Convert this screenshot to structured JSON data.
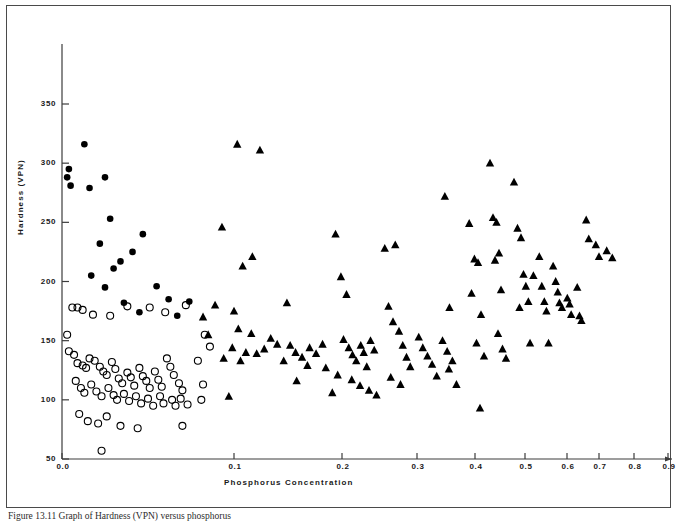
{
  "figure": {
    "caption": "Figure 13.11  Graph of Hardness (VPN) versus phosphorus"
  },
  "chart_data": {
    "type": "scatter",
    "title": "",
    "xlabel": "Phosphorus  Concentration",
    "ylabel": "Hardness  (VPN)",
    "xlim": [
      0.0,
      0.92
    ],
    "ylim": [
      50,
      360
    ],
    "grid": false,
    "legend": "none",
    "xticks": [
      0.0,
      0.1,
      0.2,
      0.3,
      0.4,
      0.5,
      0.6,
      0.7,
      0.8,
      0.9
    ],
    "xtick_labels": [
      "0.0",
      "0.1",
      "0.2",
      "0.3",
      "0.4",
      "0.5",
      "0.6",
      "0.7",
      "0.8",
      "0.9"
    ],
    "yticks": [
      50,
      100,
      150,
      200,
      250,
      300,
      350
    ],
    "ytick_labels": [
      "50",
      "100",
      "150",
      "200",
      "250",
      "300",
      "350"
    ],
    "xtick_pixels": [
      62,
      234,
      342,
      417,
      475,
      525,
      567,
      599,
      634,
      668
    ],
    "series": [
      {
        "name": "filled-circle",
        "marker": "filled-circle",
        "color": "#000000",
        "points": [
          [
            0.004,
            295
          ],
          [
            0.003,
            288
          ],
          [
            0.005,
            281
          ],
          [
            0.016,
            279
          ],
          [
            0.013,
            316
          ],
          [
            0.025,
            288
          ],
          [
            0.028,
            253
          ],
          [
            0.022,
            232
          ],
          [
            0.034,
            217
          ],
          [
            0.047,
            240
          ],
          [
            0.041,
            225
          ],
          [
            0.03,
            211
          ],
          [
            0.017,
            205
          ],
          [
            0.025,
            195
          ],
          [
            0.055,
            196
          ],
          [
            0.062,
            185
          ],
          [
            0.036,
            182
          ],
          [
            0.074,
            183
          ],
          [
            0.045,
            174
          ],
          [
            0.067,
            171
          ]
        ]
      },
      {
        "name": "open-circle",
        "marker": "open-circle",
        "color": "#000000",
        "points": [
          [
            0.003,
            155
          ],
          [
            0.006,
            178
          ],
          [
            0.009,
            178
          ],
          [
            0.012,
            176
          ],
          [
            0.018,
            172
          ],
          [
            0.028,
            171
          ],
          [
            0.038,
            179
          ],
          [
            0.051,
            178
          ],
          [
            0.06,
            174
          ],
          [
            0.072,
            180
          ],
          [
            0.004,
            141
          ],
          [
            0.007,
            138
          ],
          [
            0.009,
            131
          ],
          [
            0.012,
            129
          ],
          [
            0.014,
            127
          ],
          [
            0.016,
            135
          ],
          [
            0.019,
            133
          ],
          [
            0.022,
            128
          ],
          [
            0.024,
            124
          ],
          [
            0.026,
            121
          ],
          [
            0.029,
            132
          ],
          [
            0.031,
            126
          ],
          [
            0.033,
            118
          ],
          [
            0.035,
            114
          ],
          [
            0.038,
            123
          ],
          [
            0.04,
            119
          ],
          [
            0.042,
            112
          ],
          [
            0.045,
            127
          ],
          [
            0.047,
            120
          ],
          [
            0.049,
            116
          ],
          [
            0.051,
            110
          ],
          [
            0.054,
            124
          ],
          [
            0.056,
            117
          ],
          [
            0.058,
            111
          ],
          [
            0.061,
            135
          ],
          [
            0.063,
            128
          ],
          [
            0.065,
            121
          ],
          [
            0.068,
            114
          ],
          [
            0.07,
            108
          ],
          [
            0.008,
            116
          ],
          [
            0.011,
            110
          ],
          [
            0.013,
            106
          ],
          [
            0.017,
            113
          ],
          [
            0.02,
            107
          ],
          [
            0.023,
            103
          ],
          [
            0.027,
            110
          ],
          [
            0.03,
            104
          ],
          [
            0.032,
            100
          ],
          [
            0.036,
            105
          ],
          [
            0.039,
            99
          ],
          [
            0.043,
            103
          ],
          [
            0.046,
            97
          ],
          [
            0.05,
            101
          ],
          [
            0.053,
            95
          ],
          [
            0.057,
            103
          ],
          [
            0.059,
            97
          ],
          [
            0.064,
            100
          ],
          [
            0.066,
            95
          ],
          [
            0.069,
            101
          ],
          [
            0.073,
            96
          ],
          [
            0.01,
            88
          ],
          [
            0.015,
            82
          ],
          [
            0.021,
            80
          ],
          [
            0.026,
            86
          ],
          [
            0.034,
            78
          ],
          [
            0.044,
            76
          ],
          [
            0.07,
            78
          ],
          [
            0.023,
            57
          ],
          [
            0.081,
            100
          ],
          [
            0.082,
            113
          ],
          [
            0.079,
            133
          ],
          [
            0.083,
            155
          ],
          [
            0.086,
            145
          ]
        ]
      },
      {
        "name": "filled-triangle",
        "marker": "filled-triangle",
        "color": "#000000",
        "points": [
          [
            0.103,
            316
          ],
          [
            0.124,
            311
          ],
          [
            0.093,
            246
          ],
          [
            0.117,
            221
          ],
          [
            0.108,
            213
          ],
          [
            0.089,
            180
          ],
          [
            0.1,
            175
          ],
          [
            0.104,
            160
          ],
          [
            0.116,
            156
          ],
          [
            0.099,
            144
          ],
          [
            0.111,
            140
          ],
          [
            0.121,
            139
          ],
          [
            0.094,
            135
          ],
          [
            0.106,
            133
          ],
          [
            0.128,
            143
          ],
          [
            0.134,
            152
          ],
          [
            0.14,
            147
          ],
          [
            0.097,
            103
          ],
          [
            0.085,
            155
          ],
          [
            0.082,
            170
          ],
          [
            0.149,
            182
          ],
          [
            0.152,
            146
          ],
          [
            0.157,
            140
          ],
          [
            0.163,
            136
          ],
          [
            0.17,
            144
          ],
          [
            0.176,
            139
          ],
          [
            0.182,
            147
          ],
          [
            0.146,
            133
          ],
          [
            0.168,
            129
          ],
          [
            0.185,
            127
          ],
          [
            0.158,
            116
          ],
          [
            0.194,
            240
          ],
          [
            0.199,
            204
          ],
          [
            0.206,
            189
          ],
          [
            0.202,
            151
          ],
          [
            0.209,
            144
          ],
          [
            0.214,
            138
          ],
          [
            0.219,
            133
          ],
          [
            0.225,
            146
          ],
          [
            0.229,
            140
          ],
          [
            0.233,
            128
          ],
          [
            0.238,
            150
          ],
          [
            0.243,
            142
          ],
          [
            0.196,
            121
          ],
          [
            0.213,
            117
          ],
          [
            0.224,
            112
          ],
          [
            0.236,
            108
          ],
          [
            0.191,
            106
          ],
          [
            0.246,
            104
          ],
          [
            0.257,
            228
          ],
          [
            0.271,
            231
          ],
          [
            0.262,
            179
          ],
          [
            0.268,
            166
          ],
          [
            0.276,
            158
          ],
          [
            0.281,
            146
          ],
          [
            0.286,
            136
          ],
          [
            0.291,
            128
          ],
          [
            0.265,
            119
          ],
          [
            0.278,
            113
          ],
          [
            0.303,
            153
          ],
          [
            0.31,
            144
          ],
          [
            0.318,
            137
          ],
          [
            0.326,
            130
          ],
          [
            0.334,
            120
          ],
          [
            0.348,
            272
          ],
          [
            0.356,
            178
          ],
          [
            0.344,
            150
          ],
          [
            0.352,
            141
          ],
          [
            0.361,
            133
          ],
          [
            0.355,
            126
          ],
          [
            0.368,
            113
          ],
          [
            0.39,
            249
          ],
          [
            0.399,
            219
          ],
          [
            0.406,
            216
          ],
          [
            0.394,
            190
          ],
          [
            0.412,
            172
          ],
          [
            0.403,
            148
          ],
          [
            0.418,
            137
          ],
          [
            0.41,
            93
          ],
          [
            0.43,
            300
          ],
          [
            0.436,
            254
          ],
          [
            0.443,
            250
          ],
          [
            0.448,
            224
          ],
          [
            0.44,
            218
          ],
          [
            0.452,
            193
          ],
          [
            0.446,
            156
          ],
          [
            0.455,
            143
          ],
          [
            0.462,
            135
          ],
          [
            0.478,
            284
          ],
          [
            0.485,
            245
          ],
          [
            0.492,
            237
          ],
          [
            0.497,
            206
          ],
          [
            0.502,
            196
          ],
          [
            0.489,
            178
          ],
          [
            0.508,
            183
          ],
          [
            0.512,
            148
          ],
          [
            0.52,
            205
          ],
          [
            0.534,
            221
          ],
          [
            0.54,
            196
          ],
          [
            0.546,
            183
          ],
          [
            0.551,
            175
          ],
          [
            0.556,
            148
          ],
          [
            0.567,
            213
          ],
          [
            0.573,
            200
          ],
          [
            0.578,
            191
          ],
          [
            0.582,
            182
          ],
          [
            0.588,
            178
          ],
          [
            0.601,
            186
          ],
          [
            0.608,
            181
          ],
          [
            0.613,
            172
          ],
          [
            0.632,
            195
          ],
          [
            0.639,
            171
          ],
          [
            0.645,
            167
          ],
          [
            0.66,
            252
          ],
          [
            0.668,
            236
          ],
          [
            0.69,
            231
          ],
          [
            0.7,
            221
          ],
          [
            0.722,
            226
          ],
          [
            0.738,
            220
          ]
        ]
      }
    ]
  }
}
